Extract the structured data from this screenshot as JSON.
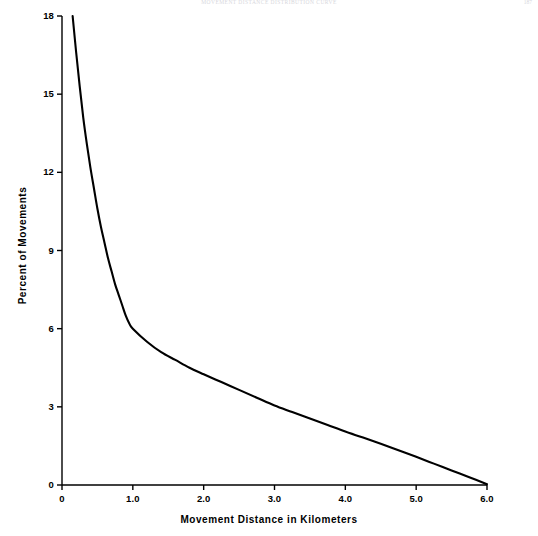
{
  "page": {
    "running_head": "Movement Distance Distribution Curve",
    "folio": "187"
  },
  "chart_data": {
    "type": "line",
    "title": "",
    "xlabel": "Movement Distance in Kilometers",
    "ylabel": "Percent of Movements",
    "xlim": [
      0,
      6.0
    ],
    "ylim": [
      0,
      18
    ],
    "grid": false,
    "legend": null,
    "x_ticks": [
      "0",
      "1.0",
      "2.0",
      "3.0",
      "4.0",
      "5.0",
      "6.0"
    ],
    "x_tick_values": [
      0,
      1.0,
      2.0,
      3.0,
      4.0,
      5.0,
      6.0
    ],
    "y_ticks": [
      "0",
      "3",
      "6",
      "9",
      "12",
      "15",
      "18"
    ],
    "y_tick_values": [
      0,
      3,
      6,
      9,
      12,
      15,
      18
    ],
    "line_color": "#000000",
    "line_width": 2.1,
    "series": [
      {
        "name": "Percent of Movements",
        "x": [
          0.15,
          0.2,
          0.25,
          0.3,
          0.35,
          0.4,
          0.45,
          0.5,
          0.55,
          0.6,
          0.65,
          0.7,
          0.75,
          0.8,
          0.85,
          0.9,
          0.95,
          1.0,
          1.2,
          1.4,
          1.6,
          1.8,
          2.0,
          2.25,
          2.5,
          2.75,
          3.0,
          3.25,
          3.5,
          3.75,
          4.0,
          4.25,
          4.5,
          4.75,
          5.0,
          5.25,
          5.5,
          5.75,
          6.0
        ],
        "y": [
          18.0,
          16.6,
          15.3,
          14.1,
          13.1,
          12.2,
          11.4,
          10.6,
          9.9,
          9.3,
          8.7,
          8.2,
          7.7,
          7.3,
          6.9,
          6.5,
          6.2,
          6.0,
          5.5,
          5.1,
          4.8,
          4.5,
          4.25,
          3.95,
          3.65,
          3.35,
          3.05,
          2.8,
          2.55,
          2.3,
          2.05,
          1.82,
          1.58,
          1.33,
          1.08,
          0.82,
          0.56,
          0.3,
          0.03
        ]
      }
    ]
  }
}
